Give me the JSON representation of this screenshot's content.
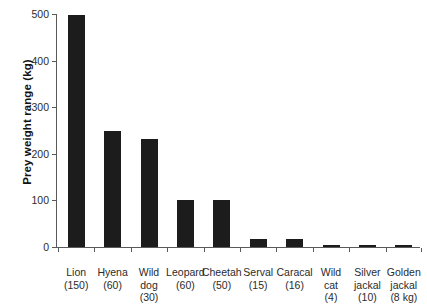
{
  "chart_data": {
    "type": "bar",
    "title": "",
    "xlabel": "",
    "ylabel": "Prey weight range (kg)",
    "ylim": [
      0,
      500
    ],
    "yticks": [
      0,
      100,
      200,
      300,
      400,
      500
    ],
    "grid": false,
    "legend": null,
    "bar_color": "#1c1c1c",
    "axis_color": "#5a5a5a",
    "categories": [
      "Lion (150)",
      "Hyena (60)",
      "Wild dog (30)",
      "Leopard (60)",
      "Cheetah (50)",
      "Serval (15)",
      "Caracal (16)",
      "Wild cat (4)",
      "Silver jackal (10)",
      "Golden jackal (8 kg)"
    ],
    "values": [
      497,
      250,
      232,
      100,
      100,
      17,
      18,
      5,
      4,
      5
    ],
    "points": [
      {
        "name": "Lion",
        "body_mass_label": "(150)",
        "lines": [
          "Lion",
          "(150)"
        ],
        "value": 497
      },
      {
        "name": "Hyena",
        "body_mass_label": "(60)",
        "lines": [
          "Hyena",
          "(60)"
        ],
        "value": 250
      },
      {
        "name": "Wild dog",
        "body_mass_label": "(30)",
        "lines": [
          "Wild",
          "dog",
          "(30)"
        ],
        "value": 232
      },
      {
        "name": "Leopard",
        "body_mass_label": "(60)",
        "lines": [
          "Leopard",
          "(60)"
        ],
        "value": 100
      },
      {
        "name": "Cheetah",
        "body_mass_label": "(50)",
        "lines": [
          "Cheetah",
          "(50)"
        ],
        "value": 100
      },
      {
        "name": "Serval",
        "body_mass_label": "(15)",
        "lines": [
          "Serval",
          "(15)"
        ],
        "value": 17
      },
      {
        "name": "Caracal",
        "body_mass_label": "(16)",
        "lines": [
          "Caracal",
          "(16)"
        ],
        "value": 18
      },
      {
        "name": "Wild cat",
        "body_mass_label": "(4)",
        "lines": [
          "Wild",
          "cat",
          "(4)"
        ],
        "value": 5
      },
      {
        "name": "Silver jackal",
        "body_mass_label": "(10)",
        "lines": [
          "Silver",
          "jackal",
          "(10)"
        ],
        "value": 4
      },
      {
        "name": "Golden jackal",
        "body_mass_label": "(8 kg)",
        "lines": [
          "Golden",
          "jackal",
          "(8 kg)"
        ],
        "value": 5
      }
    ]
  }
}
